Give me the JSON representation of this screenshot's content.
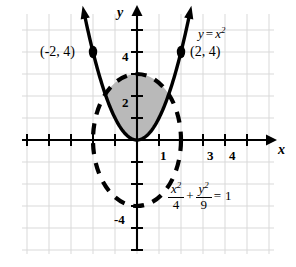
{
  "figure": {
    "axis_labels": {
      "x": "x",
      "y": "y"
    },
    "x_ticks": [
      {
        "value": 1,
        "label": "1"
      },
      {
        "value": 3,
        "label": "3"
      },
      {
        "value": 4,
        "label": "4"
      }
    ],
    "y_ticks": [
      {
        "value": 2,
        "label": "2"
      },
      {
        "value": 4,
        "label": "4"
      },
      {
        "value": -4,
        "label": "-4"
      }
    ],
    "points": [
      {
        "label": "(-2, 4)",
        "x": -2,
        "y": 4
      },
      {
        "label": "(2, 4)",
        "x": 2,
        "y": 4
      }
    ],
    "parabola_label": {
      "lhs": "y",
      "op": "=",
      "base": "x",
      "exp": "2"
    },
    "ellipse_equation": {
      "num1": "x",
      "num1_exp": "2",
      "den1": "4",
      "plus": "+",
      "num2": "y",
      "num2_exp": "2",
      "den2": "9",
      "equals": "=",
      "rhs": "1"
    },
    "colors": {
      "grid": "#d9d9d9",
      "axis": "#000000",
      "curve": "#000000",
      "shade": "#b9b9b9"
    }
  },
  "chart_data": {
    "type": "line",
    "title": "",
    "xlabel": "x",
    "ylabel": "y",
    "xlim": [
      -6.2,
      6.7
    ],
    "ylim": [
      -5.6,
      5.6
    ],
    "grid": true,
    "legend": "none",
    "origin_px": [
      137,
      140
    ],
    "unit_px": 22,
    "series": [
      {
        "name": "y = x^2",
        "kind": "parabola",
        "equation": "y = x^2",
        "a": 1,
        "style": "solid-thick-with-arrowheads",
        "points_marked": [
          [
            -2,
            4
          ],
          [
            2,
            4
          ]
        ]
      },
      {
        "name": "x^2/4 + y^2/9 = 1",
        "kind": "ellipse",
        "equation": "x^2/4 + y^2/9 = 1",
        "center": [
          0,
          0
        ],
        "semi_axis_x": 2,
        "semi_axis_y": 3,
        "style": "dashed-thick"
      }
    ],
    "shaded_region": {
      "description": "inside ellipse and above parabola",
      "fill": "#b9b9b9",
      "vertices": [
        [
          -2,
          4
        ],
        [
          2,
          4
        ]
      ]
    },
    "annotations": [
      {
        "text": "(-2, 4)",
        "x": -2,
        "y": 4
      },
      {
        "text": "(2, 4)",
        "x": 2,
        "y": 4
      },
      {
        "text": "y = x^2",
        "x": 3.1,
        "y": 4.9
      },
      {
        "text": "x^2/4 + y^2/9 = 1",
        "x": 1.6,
        "y": -2.9
      }
    ]
  }
}
